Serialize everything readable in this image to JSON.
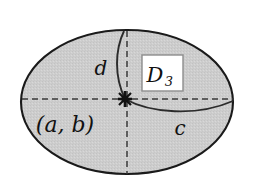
{
  "figure": {
    "background_color": "#ffffff",
    "shape": {
      "kind": "ellipse",
      "fill_color": "#cdcdcd",
      "stroke_color": "#1a1a1a",
      "center_x": 127,
      "center_y": 102,
      "radius_x": 106,
      "radius_y": 72
    },
    "center_point": {
      "name": "marked-center",
      "x": 125,
      "y": 99,
      "marker": "star-cross",
      "color": "#111111"
    },
    "axes": {
      "horizontal_dashed": {
        "x1": 22,
        "y1": 99,
        "x2": 234,
        "y2": 99,
        "style": "dashed",
        "color": "#3a3a3a"
      },
      "vertical_dashed": {
        "x1": 127,
        "y1": 31,
        "x2": 127,
        "y2": 174,
        "style": "dashed",
        "color": "#3a3a3a"
      }
    },
    "curves": [
      {
        "id": "curve-d",
        "label": "d",
        "description": "solid curve from top of ellipse to center point, bowing left",
        "path": "M 124 31 C 115 50, 114 76, 125 99",
        "color": "#2b2b2b"
      },
      {
        "id": "curve-c",
        "label": "c",
        "description": "solid curve from center point to right edge of ellipse, bowing down",
        "path": "M 125 99 C 150 113, 196 117, 233 101",
        "color": "#2b2b2b"
      }
    ],
    "labels": {
      "d": "d",
      "c": "c",
      "coordinates": "(a, b)",
      "region_letter": "D",
      "region_subscript": "3"
    },
    "label_positions": {
      "d": {
        "x": 101,
        "y": 75
      },
      "c": {
        "x": 180,
        "y": 135
      },
      "coordinates": {
        "x": 65,
        "y": 132
      },
      "region_box": {
        "x": 142,
        "y": 55,
        "width": 41,
        "height": 36
      }
    }
  }
}
